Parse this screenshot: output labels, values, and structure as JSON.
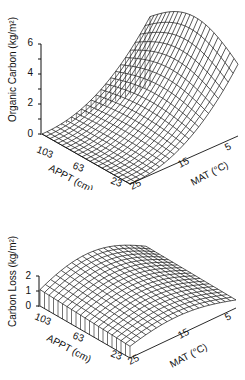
{
  "chart_data": [
    {
      "type": "surface3d",
      "title": "",
      "zlabel": "Organic Carbon (kg/m²)",
      "xlabel": "APPT (cm)",
      "ylabel": "MAT (°C)",
      "z_ticks": [
        "0",
        "2",
        "4",
        "6"
      ],
      "z_range": [
        0,
        6.5
      ],
      "x_ticks": [
        "103",
        "63",
        "23"
      ],
      "y_ticks": [
        "25",
        "15",
        "5"
      ],
      "x_range": [
        23,
        103
      ],
      "y_range": [
        5,
        25
      ],
      "surface_samples": [
        {
          "APPT": 23,
          "MAT": 25,
          "value": 0.0
        },
        {
          "APPT": 103,
          "MAT": 25,
          "value": 0.0
        },
        {
          "APPT": 103,
          "MAT": 5,
          "value": 6.2
        },
        {
          "APPT": 63,
          "MAT": 5,
          "value": 6.5
        },
        {
          "APPT": 23,
          "MAT": 5,
          "value": 4.3
        },
        {
          "APPT": 63,
          "MAT": 15,
          "value": 2.5
        }
      ]
    },
    {
      "type": "surface3d",
      "title": "",
      "zlabel": "Carbon Loss (kg/m²)",
      "xlabel": "APPT (cm)",
      "ylabel": "MAT (°C)",
      "z_ticks": [
        "0",
        "1",
        "2"
      ],
      "z_range": [
        0,
        2
      ],
      "x_ticks": [
        "103",
        "63",
        "23"
      ],
      "y_ticks": [
        "25",
        "15",
        "5"
      ],
      "x_range": [
        23,
        103
      ],
      "y_range": [
        5,
        25
      ],
      "surface_samples": [
        {
          "APPT": 23,
          "MAT": 25,
          "value": 0.1
        },
        {
          "APPT": 103,
          "MAT": 25,
          "value": 0.6
        },
        {
          "APPT": 103,
          "MAT": 5,
          "value": 2.0
        },
        {
          "APPT": 63,
          "MAT": 5,
          "value": 2.1
        },
        {
          "APPT": 23,
          "MAT": 5,
          "value": 0.9
        },
        {
          "APPT": 63,
          "MAT": 15,
          "value": 1.5
        }
      ]
    }
  ],
  "top": {
    "zlabel": "Organic Carbon (kg/m²)",
    "zticks": [
      "6",
      "4",
      "2",
      "0"
    ],
    "xticks": [
      "103",
      "63",
      "23"
    ],
    "yticks": [
      "25",
      "15",
      "5"
    ],
    "xlabel": "APPT (cm)",
    "ylabel": "MAT (°C)"
  },
  "bottom": {
    "zlabel": "Carbon Loss (kg/m²)",
    "zticks": [
      "2",
      "1",
      "0"
    ],
    "xticks": [
      "103",
      "63",
      "23"
    ],
    "yticks": [
      "25",
      "15",
      "5"
    ],
    "xlabel": "APPT (cm)",
    "ylabel": "MAT (°C)"
  }
}
